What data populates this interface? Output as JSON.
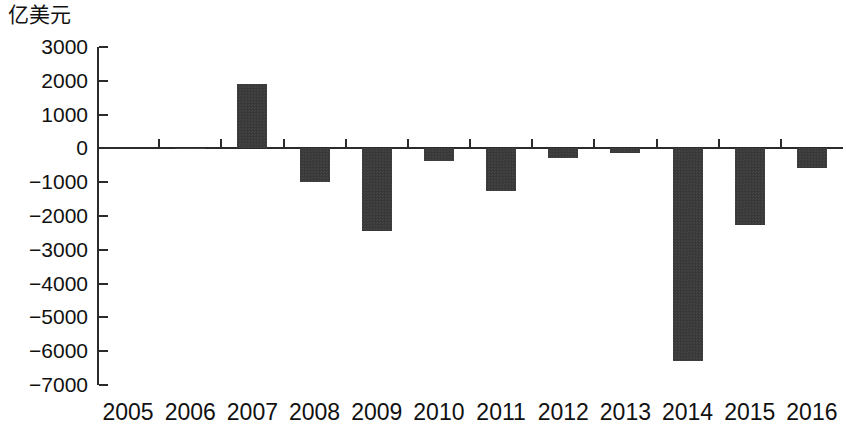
{
  "chart_data": {
    "type": "bar",
    "title": "",
    "subtitle": "",
    "unit_label": "亿美元",
    "xlabel": "",
    "ylabel": "亿美元",
    "categories": [
      "2005",
      "2006",
      "2007",
      "2008",
      "2009",
      "2010",
      "2011",
      "2012",
      "2013",
      "2014",
      "2015",
      "2016"
    ],
    "values": [
      0,
      -30,
      1920,
      -1000,
      -2430,
      -370,
      -1250,
      -280,
      -130,
      -6300,
      -2280,
      -570
    ],
    "series": [
      {
        "name": "",
        "values": [
          0,
          -30,
          1920,
          -1000,
          -2430,
          -370,
          -1250,
          -280,
          -130,
          -6300,
          -2280,
          -570
        ]
      }
    ],
    "ylim": [
      -7000,
      3000
    ],
    "ytick_labels": [
      "3000",
      "2000",
      "1000",
      "0",
      "−1000",
      "−2000",
      "−3000",
      "−4000",
      "−5000",
      "−6000",
      "−7000"
    ],
    "ytick_values": [
      3000,
      2000,
      1000,
      0,
      -1000,
      -2000,
      -3000,
      -4000,
      -5000,
      -6000,
      -7000
    ],
    "grid": false,
    "legend": false,
    "legend_position": "none",
    "bar_color": "#3b3b3b",
    "axis_color": "#2b2b2b",
    "background_color": "#ffffff"
  }
}
